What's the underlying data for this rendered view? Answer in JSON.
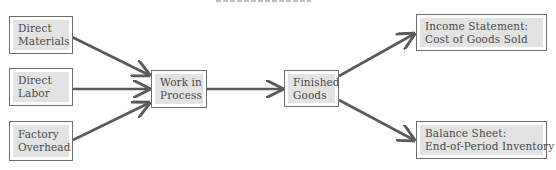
{
  "diagram": {
    "title": "",
    "colors": {
      "border": "#6e6e6e",
      "fill": "#e3e3e3",
      "arrow": "#5a5a5a",
      "text": "#4a4a4a"
    },
    "nodes": {
      "direct_materials": {
        "line1": "Direct",
        "line2": "Materials"
      },
      "direct_labor": {
        "line1": "Direct",
        "line2": "Labor"
      },
      "factory_overhead": {
        "line1": "Factory",
        "line2": "Overhead"
      },
      "work_in_process": {
        "line1": "Work in",
        "line2": "Process"
      },
      "finished_goods": {
        "line1": "Finished",
        "line2": "Goods"
      },
      "income_statement": {
        "line1": "Income Statement:",
        "line2": "Cost of Goods Sold"
      },
      "balance_sheet": {
        "line1": "Balance Sheet:",
        "line2": "End-of-Period Inventory"
      }
    },
    "edges": [
      {
        "from": "direct_materials",
        "to": "work_in_process"
      },
      {
        "from": "direct_labor",
        "to": "work_in_process"
      },
      {
        "from": "factory_overhead",
        "to": "work_in_process"
      },
      {
        "from": "work_in_process",
        "to": "finished_goods"
      },
      {
        "from": "finished_goods",
        "to": "income_statement"
      },
      {
        "from": "finished_goods",
        "to": "balance_sheet"
      }
    ]
  }
}
